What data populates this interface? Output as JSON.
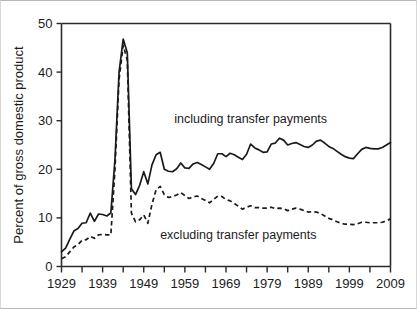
{
  "chart_data": {
    "type": "line",
    "title": "",
    "xlabel": "",
    "ylabel": "Percent of gross domestic product",
    "xlim": [
      1929,
      2009
    ],
    "ylim": [
      0,
      50
    ],
    "yticks": [
      0,
      10,
      20,
      30,
      40,
      50
    ],
    "ytick_labels": [
      "0",
      "10",
      "20",
      "30",
      "40",
      "50"
    ],
    "xticks": [
      1929,
      1939,
      1949,
      1959,
      1969,
      1979,
      1989,
      1999,
      2009
    ],
    "xtick_labels": [
      "1929",
      "1939",
      "1949",
      "1959",
      "1969",
      "1979",
      "1989",
      "1999",
      "2009"
    ],
    "xtick_minor_step": 5,
    "grid": false,
    "legend_position": "inline-annotations",
    "annotations": [
      {
        "text": "including transfer payments",
        "x": 1975,
        "y": 29.6,
        "series": "including transfer payments"
      },
      {
        "text": "excluding transfer payments",
        "x": 1972,
        "y": 5.6,
        "series": "excluding transfer payments"
      }
    ],
    "x": [
      1929,
      1930,
      1931,
      1932,
      1933,
      1934,
      1935,
      1936,
      1937,
      1938,
      1939,
      1940,
      1941,
      1942,
      1943,
      1944,
      1945,
      1946,
      1947,
      1948,
      1949,
      1950,
      1951,
      1952,
      1953,
      1954,
      1955,
      1956,
      1957,
      1958,
      1959,
      1960,
      1961,
      1962,
      1963,
      1964,
      1965,
      1966,
      1967,
      1968,
      1969,
      1970,
      1971,
      1972,
      1973,
      1974,
      1975,
      1976,
      1977,
      1978,
      1979,
      1980,
      1981,
      1982,
      1983,
      1984,
      1985,
      1986,
      1987,
      1988,
      1989,
      1990,
      1991,
      1992,
      1993,
      1994,
      1995,
      1996,
      1997,
      1998,
      1999,
      2000,
      2001,
      2002,
      2003,
      2004,
      2005,
      2006,
      2007,
      2008,
      2009
    ],
    "series": [
      {
        "name": "including transfer payments",
        "style": "solid",
        "values": [
          3.0,
          3.8,
          5.6,
          7.3,
          7.8,
          8.9,
          9.0,
          11.0,
          9.3,
          10.8,
          10.7,
          10.4,
          11.0,
          22.0,
          40.0,
          46.8,
          44.0,
          16.0,
          14.8,
          16.7,
          19.5,
          17.0,
          20.9,
          23.0,
          23.5,
          20.0,
          19.6,
          19.5,
          20.1,
          21.3,
          20.3,
          20.2,
          21.1,
          21.4,
          21.0,
          20.5,
          20.0,
          21.2,
          23.2,
          23.2,
          22.6,
          23.3,
          23.0,
          22.5,
          22.0,
          23.1,
          25.2,
          24.4,
          24.0,
          23.5,
          23.6,
          25.2,
          25.4,
          26.4,
          26.0,
          25.0,
          25.3,
          25.5,
          25.1,
          24.7,
          24.5,
          25.0,
          25.8,
          26.0,
          25.4,
          24.7,
          24.3,
          23.7,
          23.1,
          22.6,
          22.3,
          22.2,
          23.2,
          24.1,
          24.5,
          24.3,
          24.2,
          24.2,
          24.5,
          25.0,
          25.5
        ]
      },
      {
        "name": "excluding transfer payments",
        "style": "dashed",
        "values": [
          1.6,
          2.0,
          3.0,
          4.0,
          4.5,
          5.4,
          5.5,
          6.2,
          5.8,
          6.5,
          6.6,
          6.5,
          6.5,
          20.0,
          38.5,
          45.5,
          42.5,
          11.0,
          9.2,
          9.6,
          10.6,
          8.9,
          12.8,
          15.8,
          16.5,
          14.8,
          14.2,
          14.4,
          14.7,
          15.2,
          14.6,
          14.0,
          14.3,
          14.5,
          14.0,
          13.6,
          13.1,
          13.8,
          14.5,
          14.4,
          13.8,
          13.5,
          13.0,
          12.4,
          11.8,
          12.2,
          12.5,
          12.1,
          12.1,
          12.0,
          12.0,
          12.2,
          11.9,
          12.0,
          11.9,
          11.5,
          11.8,
          12.0,
          11.8,
          11.5,
          11.2,
          11.3,
          11.2,
          10.9,
          10.4,
          9.9,
          9.6,
          9.2,
          8.9,
          8.7,
          8.7,
          8.6,
          8.8,
          9.1,
          9.1,
          9.0,
          9.0,
          9.0,
          9.1,
          9.4,
          9.8
        ]
      }
    ]
  },
  "figure": {
    "background": "#ffffff",
    "line_color": "#1a1a1a",
    "axis_color": "#2b2b2b",
    "border_color": "#b8b8b8"
  }
}
